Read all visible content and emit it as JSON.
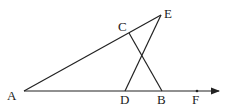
{
  "diagram": {
    "type": "geometry",
    "points": {
      "A": {
        "label": "A",
        "x": 24,
        "y": 91
      },
      "B": {
        "label": "B",
        "x": 162,
        "y": 91
      },
      "C": {
        "label": "C",
        "x": 129,
        "y": 33
      },
      "D": {
        "label": "D",
        "x": 125,
        "y": 91
      },
      "E": {
        "label": "E",
        "x": 161,
        "y": 15
      },
      "F": {
        "label": "F",
        "x": 197,
        "y": 91
      }
    },
    "segments": [
      "AE",
      "CB",
      "DE"
    ],
    "ray": {
      "from": "A",
      "through": "F",
      "label": "ray AF"
    },
    "color": "#222222"
  }
}
